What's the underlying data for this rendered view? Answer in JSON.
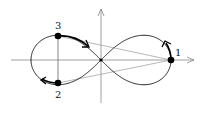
{
  "diagram": {
    "type": "lemniscate-of-bernoulli",
    "origin": [
      101,
      60
    ],
    "a": 70,
    "colors": {
      "curve": "#222222",
      "axis": "#888888",
      "chord": "#888888",
      "point": "#000000"
    },
    "points": [
      {
        "label": "1",
        "x": 171,
        "y": 60,
        "label_x": 176,
        "label_y": 55
      },
      {
        "label": "2",
        "x": 58,
        "y": 83,
        "label_x": 55,
        "label_y": 98
      },
      {
        "label": "3",
        "x": 58,
        "y": 36,
        "label_x": 55,
        "label_y": 29
      }
    ],
    "axes": {
      "x": {
        "from": 11,
        "to": 195,
        "y": 60
      },
      "y": {
        "from": 103,
        "to": 8,
        "x": 101
      }
    }
  }
}
